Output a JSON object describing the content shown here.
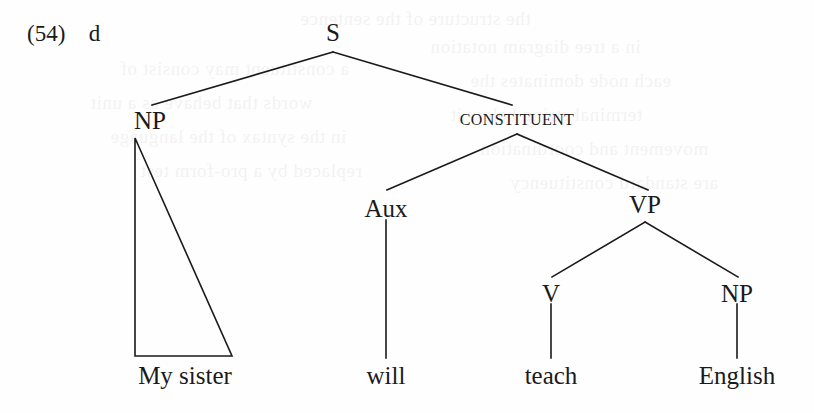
{
  "example": {
    "number": "(54)",
    "letter": "d"
  },
  "tree": {
    "nodes": [
      {
        "id": "s",
        "label": "S",
        "x": 333,
        "y": 20,
        "style": "cat"
      },
      {
        "id": "np1",
        "label": "NP",
        "x": 150,
        "y": 108,
        "style": "cat"
      },
      {
        "id": "const",
        "label": "CONSTITUENT",
        "x": 517,
        "y": 112,
        "style": "smallcaps"
      },
      {
        "id": "aux",
        "label": "Aux",
        "x": 386,
        "y": 196,
        "style": "cat"
      },
      {
        "id": "vp",
        "label": "VP",
        "x": 645,
        "y": 192,
        "style": "cat"
      },
      {
        "id": "v",
        "label": "V",
        "x": 551,
        "y": 281,
        "style": "cat"
      },
      {
        "id": "np2",
        "label": "NP",
        "x": 737,
        "y": 281,
        "style": "cat"
      }
    ],
    "terminals": [
      {
        "id": "t-my-sister",
        "label": "My sister",
        "x": 185,
        "y": 363
      },
      {
        "id": "t-will",
        "label": "will",
        "x": 386,
        "y": 363
      },
      {
        "id": "t-teach",
        "label": "teach",
        "x": 551,
        "y": 363
      },
      {
        "id": "t-english",
        "label": "English",
        "x": 737,
        "y": 363
      }
    ],
    "edges": [
      {
        "id": "s-np1",
        "from": "S",
        "to": "NP",
        "x1": 333,
        "y1": 52,
        "x2": 152,
        "y2": 105
      },
      {
        "id": "s-const",
        "from": "S",
        "to": "CONSTITUENT",
        "x1": 333,
        "y1": 52,
        "x2": 512,
        "y2": 105
      },
      {
        "id": "const-aux",
        "from": "CONSTITUENT",
        "to": "Aux",
        "x1": 517,
        "y1": 134,
        "x2": 387,
        "y2": 190
      },
      {
        "id": "const-vp",
        "from": "CONSTITUENT",
        "to": "VP",
        "x1": 517,
        "y1": 134,
        "x2": 648,
        "y2": 190
      },
      {
        "id": "vp-v",
        "from": "VP",
        "to": "V",
        "x1": 645,
        "y1": 222,
        "x2": 552,
        "y2": 277
      },
      {
        "id": "vp-np2",
        "from": "VP",
        "to": "NP",
        "x1": 645,
        "y1": 222,
        "x2": 738,
        "y2": 277
      },
      {
        "id": "aux-will",
        "from": "Aux",
        "to": "will",
        "x1": 386,
        "y1": 220,
        "x2": 386,
        "y2": 358
      },
      {
        "id": "v-teach",
        "from": "V",
        "to": "teach",
        "x1": 551,
        "y1": 304,
        "x2": 551,
        "y2": 358
      },
      {
        "id": "np2-english",
        "from": "NP",
        "to": "English",
        "x1": 737,
        "y1": 304,
        "x2": 737,
        "y2": 358
      }
    ],
    "triangle": {
      "id": "np1-triangle",
      "dominates": "My sister",
      "apex_x": 135,
      "apex_y": 138,
      "left_x": 135,
      "left_y": 356,
      "right_x": 232,
      "right_y": 356
    },
    "line_color": "#1a1a1a",
    "line_width": 1.6
  },
  "bleed_through": [
    {
      "text": "the structure of the sentence",
      "x": 300,
      "y": 8
    },
    {
      "text": "a constituent may consist of",
      "x": 120,
      "y": 58
    },
    {
      "text": "words that behave as a unit",
      "x": 90,
      "y": 92
    },
    {
      "text": "in the syntax of the language",
      "x": 110,
      "y": 126
    },
    {
      "text": "replaced by a pro-form test",
      "x": 140,
      "y": 160
    },
    {
      "text": "in a tree diagram notation",
      "x": 430,
      "y": 36
    },
    {
      "text": "each node dominates the",
      "x": 470,
      "y": 70
    },
    {
      "text": "terminal string below it",
      "x": 450,
      "y": 104
    },
    {
      "text": "movement and coordination",
      "x": 480,
      "y": 138
    },
    {
      "text": "are standard constituency",
      "x": 510,
      "y": 172
    }
  ]
}
